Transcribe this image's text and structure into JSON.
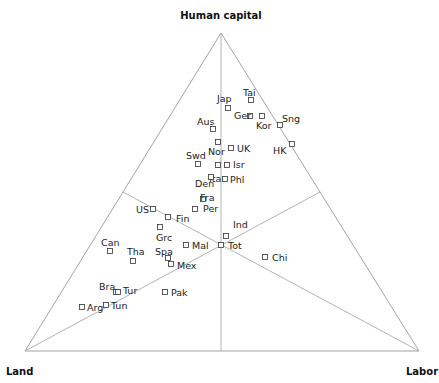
{
  "chart_data": {
    "type": "scatter",
    "subtype": "ternary",
    "title": "",
    "vertices": {
      "top": "Human capital",
      "left": "Land",
      "right": "Labor"
    },
    "grid": false,
    "legend": null,
    "medians_drawn": true,
    "points": [
      {
        "label": "Tai",
        "x": 251,
        "y": 100,
        "lx": 243,
        "ly": 96
      },
      {
        "label": "Jap",
        "x": 228,
        "y": 108,
        "lx": 217,
        "ly": 102
      },
      {
        "label": "Ger",
        "x": 250,
        "y": 116,
        "lx": 234,
        "ly": 119
      },
      {
        "label": "Kor",
        "x": 262,
        "y": 116,
        "lx": 256,
        "ly": 129
      },
      {
        "label": "Sng",
        "x": 280,
        "y": 125,
        "lx": 282,
        "ly": 122
      },
      {
        "label": "Aus",
        "x": 213,
        "y": 129,
        "lx": 197,
        "ly": 125
      },
      {
        "label": "HK",
        "x": 292,
        "y": 144,
        "lx": 273,
        "ly": 154
      },
      {
        "label": "Nor",
        "x": 218,
        "y": 142,
        "lx": 208,
        "ly": 155
      },
      {
        "label": "UK",
        "x": 231,
        "y": 148,
        "lx": 237,
        "ly": 152
      },
      {
        "label": "Swd",
        "x": 198,
        "y": 164,
        "lx": 186,
        "ly": 159
      },
      {
        "label": "Ita",
        "x": 218,
        "y": 165,
        "lx": 209,
        "ly": 182
      },
      {
        "label": "Isr",
        "x": 227,
        "y": 165,
        "lx": 233,
        "ly": 168
      },
      {
        "label": "Phl",
        "x": 225,
        "y": 179,
        "lx": 230,
        "ly": 183
      },
      {
        "label": "Den",
        "x": 211,
        "y": 177,
        "lx": 195,
        "ly": 187
      },
      {
        "label": "Fra",
        "x": 203,
        "y": 199,
        "lx": 200,
        "ly": 201
      },
      {
        "label": "Per",
        "x": 195,
        "y": 209,
        "lx": 203,
        "ly": 212
      },
      {
        "label": "US",
        "x": 153,
        "y": 209,
        "lx": 136,
        "ly": 213
      },
      {
        "label": "Fin",
        "x": 168,
        "y": 217,
        "lx": 176,
        "ly": 222
      },
      {
        "label": "Grc",
        "x": 160,
        "y": 227,
        "lx": 156,
        "ly": 241
      },
      {
        "label": "Mal",
        "x": 186,
        "y": 245,
        "lx": 192,
        "ly": 249
      },
      {
        "label": "Ind",
        "x": 226,
        "y": 236,
        "lx": 233,
        "ly": 228
      },
      {
        "label": "Tot",
        "x": 221,
        "y": 245,
        "lx": 228,
        "ly": 249
      },
      {
        "label": "Can",
        "x": 110,
        "y": 251,
        "lx": 101,
        "ly": 246
      },
      {
        "label": "Tha",
        "x": 133,
        "y": 261,
        "lx": 127,
        "ly": 255
      },
      {
        "label": "Spa",
        "x": 168,
        "y": 258,
        "lx": 155,
        "ly": 255
      },
      {
        "label": "Mex",
        "x": 171,
        "y": 264,
        "lx": 177,
        "ly": 269
      },
      {
        "label": "Chi",
        "x": 265,
        "y": 257,
        "lx": 272,
        "ly": 261
      },
      {
        "label": "Bra",
        "x": 116,
        "y": 292,
        "lx": 99,
        "ly": 290
      },
      {
        "label": "Tur",
        "x": 118,
        "y": 292,
        "lx": 123,
        "ly": 294
      },
      {
        "label": "Pak",
        "x": 165,
        "y": 292,
        "lx": 171,
        "ly": 296
      },
      {
        "label": "Tun",
        "x": 106,
        "y": 305,
        "lx": 111,
        "ly": 309
      },
      {
        "label": "Arg",
        "x": 82,
        "y": 307,
        "lx": 87,
        "ly": 311
      }
    ]
  },
  "labels": {
    "top": "Human capital",
    "left": "Land",
    "right": "Labor"
  }
}
